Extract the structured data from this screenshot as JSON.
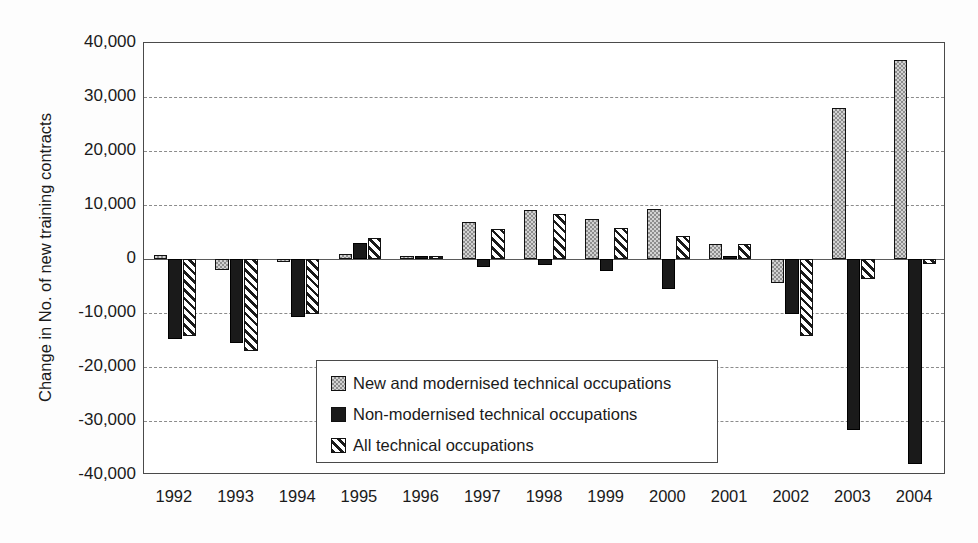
{
  "chart_data": {
    "type": "bar",
    "title": "",
    "subtitle": "",
    "xlabel": "",
    "ylabel": "Change in No. of new training contracts",
    "categories": [
      "1992",
      "1993",
      "1994",
      "1995",
      "1996",
      "1997",
      "1998",
      "1999",
      "2000",
      "2001",
      "2002",
      "2003",
      "2004"
    ],
    "series": [
      {
        "name": "New and modernised technical occupations",
        "pattern": "stipple",
        "values": [
          700,
          -2000,
          -400,
          900,
          100,
          6800,
          9000,
          7500,
          9200,
          2700,
          -4400,
          28000,
          36800
        ]
      },
      {
        "name": "Non-modernised technical occupations",
        "pattern": "solid-black",
        "values": [
          -14900,
          -15500,
          -10700,
          2900,
          400,
          -1500,
          -1200,
          -2200,
          -5600,
          0,
          -10200,
          -31600,
          -38000
        ]
      },
      {
        "name": "All technical occupations",
        "pattern": "diagonal-hatch",
        "values": [
          -14200,
          -17000,
          -10200,
          3900,
          600,
          5600,
          8400,
          5700,
          4200,
          2700,
          -14300,
          -3700,
          -1000
        ]
      }
    ],
    "ylim": [
      -40000,
      40000
    ],
    "yticks": [
      40000,
      30000,
      20000,
      10000,
      0,
      -10000,
      -20000,
      -30000,
      -40000
    ],
    "ytick_labels": [
      "40,000",
      "30,000",
      "20,000",
      "10,000",
      "0",
      "-10,000",
      "-20,000",
      "-30,000",
      "-40,000"
    ],
    "grid": true,
    "grid_axis": "y",
    "legend_position": "center-lower",
    "colors": {
      "series_1": "#d2d2d2",
      "series_2": "#1a1a1a",
      "series_3": "#ffffff",
      "axis": "#4a4a4a",
      "grid": "#8c8c8c",
      "text": "#1a1a1a",
      "background": "#ffffff"
    }
  }
}
